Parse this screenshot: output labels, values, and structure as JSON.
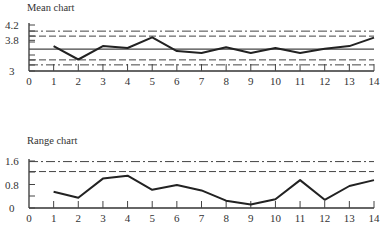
{
  "chart_data": [
    {
      "type": "line",
      "title": "Mean chart",
      "xlabel": "",
      "ylabel": "",
      "x": [
        1,
        2,
        3,
        4,
        5,
        6,
        7,
        8,
        9,
        10,
        11,
        12,
        13,
        14
      ],
      "values": [
        3.65,
        3.3,
        3.65,
        3.6,
        3.88,
        3.52,
        3.47,
        3.62,
        3.47,
        3.6,
        3.47,
        3.58,
        3.65,
        3.87
      ],
      "xticks": [
        "0",
        "1",
        "2",
        "3",
        "4",
        "5",
        "6",
        "7",
        "8",
        "9",
        "10",
        "11",
        "12",
        "13",
        "14"
      ],
      "yticks": [
        "3",
        "3.8",
        "4.2"
      ],
      "ylim": [
        3,
        4.2
      ],
      "xlim": [
        0,
        14
      ],
      "reference_lines": [
        {
          "name": "upper action limit",
          "style": "dash-dot",
          "value": 4.04
        },
        {
          "name": "upper warning limit",
          "style": "dashed",
          "value": 3.91
        },
        {
          "name": "centre line",
          "style": "solid",
          "value": 3.57
        },
        {
          "name": "lower warning limit",
          "style": "dashed",
          "value": 3.29
        },
        {
          "name": "lower action limit",
          "style": "dash-dot",
          "value": 3.16
        }
      ],
      "grid": false
    },
    {
      "type": "line",
      "title": "Range chart",
      "xlabel": "",
      "ylabel": "",
      "x": [
        1,
        2,
        3,
        4,
        5,
        6,
        7,
        8,
        9,
        10,
        11,
        12,
        13,
        14
      ],
      "values": [
        0.55,
        0.35,
        1.0,
        1.1,
        0.62,
        0.78,
        0.6,
        0.25,
        0.12,
        0.3,
        0.95,
        0.28,
        0.75,
        0.95
      ],
      "xticks": [
        "0",
        "1",
        "2",
        "3",
        "4",
        "5",
        "6",
        "7",
        "8",
        "9",
        "10",
        "11",
        "12",
        "13",
        "14"
      ],
      "yticks": [
        "0",
        "0.8",
        "1.6"
      ],
      "ylim": [
        0,
        1.6
      ],
      "xlim": [
        0,
        14
      ],
      "reference_lines": [
        {
          "name": "upper action limit",
          "style": "dash-dot",
          "value": 1.58
        },
        {
          "name": "upper warning limit",
          "style": "dashed",
          "value": 1.24
        }
      ],
      "grid": false
    }
  ],
  "labels": {
    "mean_title": "Mean chart",
    "range_title": "Range chart"
  }
}
